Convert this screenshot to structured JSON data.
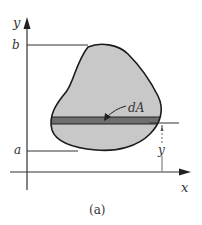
{
  "figure": {
    "caption": "(a)",
    "axes": {
      "x_label": "x",
      "y_label": "y"
    },
    "bounds": {
      "upper_label": "b",
      "lower_label": "a"
    },
    "element": {
      "label": "dA",
      "description": "horizontal differential strip within region"
    },
    "dimension": {
      "label": "y",
      "description": "distance from x-axis to strip"
    },
    "colors": {
      "region_fill": "#c8c8c8",
      "strip_fill": "#6e6e6e",
      "outline": "#1a1a1a",
      "lines": "#333333"
    }
  }
}
